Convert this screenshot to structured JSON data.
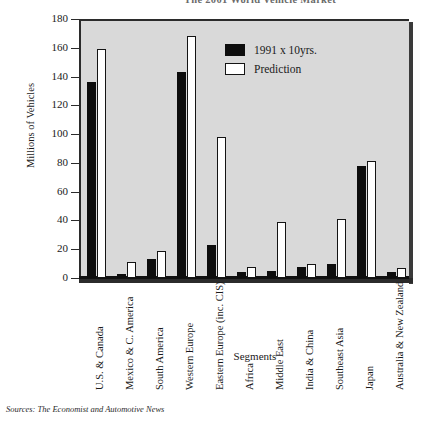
{
  "chart_data": {
    "type": "bar",
    "title": "The 2001 World Vehicle Market",
    "xlabel": "Segments",
    "ylabel": "Millions of Vehicles",
    "ylim": [
      0,
      180
    ],
    "ytick_step": 20,
    "grid": false,
    "legend_position": "upper-right",
    "categories": [
      "U.S. & Canada",
      "Mexico & C. America",
      "South America",
      "Western Europe",
      "Eastern Europe (inc. CIS)",
      "Africa",
      "Middle East",
      "India & China",
      "Southeast Asia",
      "Japan",
      "Australia & New Zealand"
    ],
    "series": [
      {
        "name": "1991 x 10yrs.",
        "values": [
          136,
          3,
          13,
          143,
          23,
          4,
          5,
          8,
          10,
          78,
          4
        ]
      },
      {
        "name": "Prediction",
        "values": [
          159,
          11,
          19,
          168,
          98,
          8,
          39,
          10,
          41,
          81,
          7
        ]
      }
    ],
    "yticks": [
      0,
      20,
      40,
      60,
      80,
      100,
      120,
      140,
      160,
      180
    ],
    "colors": {
      "actual": "#0d0d0d",
      "prediction": "#ffffff",
      "outline": "#141414",
      "plot_bg": "#d9d9d9"
    }
  },
  "legend": {
    "items": [
      {
        "label": "1991 x 10yrs.",
        "swatch": "filled-square-icon"
      },
      {
        "label": "Prediction",
        "swatch": "hollow-square-icon"
      }
    ]
  },
  "footer": {
    "source_note": "Sources: The Economist and Automotive News"
  }
}
